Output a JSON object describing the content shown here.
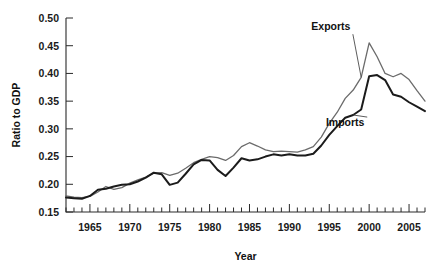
{
  "chart_data": {
    "type": "line",
    "title": "",
    "xlabel": "Year",
    "ylabel": "Ratio to GDP",
    "xlim": [
      1962,
      2007
    ],
    "ylim": [
      0.15,
      0.5
    ],
    "grid": false,
    "legend_position": "inline-annotation",
    "y_ticks": [
      "0.15",
      "0.20",
      "0.25",
      "0.30",
      "0.35",
      "0.40",
      "0.45",
      "0.50"
    ],
    "y_tick_values": [
      0.15,
      0.2,
      0.25,
      0.3,
      0.35,
      0.4,
      0.45,
      0.5
    ],
    "x_ticks": [
      "1965",
      "1970",
      "1975",
      "1980",
      "1985",
      "1990",
      "1995",
      "2000",
      "2005"
    ],
    "x_tick_values": [
      1965,
      1970,
      1975,
      1980,
      1985,
      1990,
      1995,
      2000,
      2005
    ],
    "x_minor_tick_step": 1,
    "x": [
      1962,
      1963,
      1964,
      1965,
      1966,
      1967,
      1968,
      1969,
      1970,
      1971,
      1972,
      1973,
      1974,
      1975,
      1976,
      1977,
      1978,
      1979,
      1980,
      1981,
      1982,
      1983,
      1984,
      1985,
      1986,
      1987,
      1988,
      1989,
      1990,
      1991,
      1992,
      1993,
      1994,
      1995,
      1996,
      1997,
      1998,
      1999,
      2000,
      2001,
      2002,
      2003,
      2004,
      2005,
      2006,
      2007
    ],
    "series": [
      {
        "name": "Exports",
        "color": "#6b6b6b",
        "width": 1.3,
        "values": [
          0.179,
          0.177,
          0.176,
          0.178,
          0.186,
          0.196,
          0.191,
          0.194,
          0.202,
          0.208,
          0.213,
          0.22,
          0.221,
          0.216,
          0.22,
          0.229,
          0.239,
          0.245,
          0.25,
          0.248,
          0.243,
          0.252,
          0.268,
          0.275,
          0.269,
          0.262,
          0.259,
          0.26,
          0.259,
          0.258,
          0.262,
          0.268,
          0.285,
          0.31,
          0.33,
          0.355,
          0.37,
          0.393,
          0.455,
          0.43,
          0.4,
          0.394,
          0.4,
          0.389,
          0.369,
          0.35
        ]
      },
      {
        "name": "Imports",
        "color": "#1b1b1b",
        "width": 2.0,
        "values": [
          0.176,
          0.175,
          0.174,
          0.179,
          0.19,
          0.192,
          0.196,
          0.199,
          0.2,
          0.205,
          0.212,
          0.221,
          0.218,
          0.199,
          0.203,
          0.219,
          0.236,
          0.244,
          0.243,
          0.226,
          0.215,
          0.23,
          0.247,
          0.243,
          0.245,
          0.25,
          0.254,
          0.252,
          0.254,
          0.252,
          0.252,
          0.255,
          0.27,
          0.289,
          0.305,
          0.32,
          0.325,
          0.335,
          0.395,
          0.397,
          0.388,
          0.362,
          0.358,
          0.348,
          0.34,
          0.332
        ]
      }
    ],
    "annotations": [
      {
        "text": "Exports",
        "series": "Exports",
        "x": 1999,
        "label_x": 1995.2,
        "label_y": 0.478
      },
      {
        "text": "Imports",
        "series": "Imports",
        "x": 1998,
        "label_x": 1997.0,
        "label_y": 0.305
      }
    ]
  }
}
